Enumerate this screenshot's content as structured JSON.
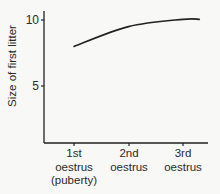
{
  "chart_data": {
    "type": "line",
    "title": "",
    "xlabel": "",
    "ylabel": "Size of first litter",
    "categories": [
      "1st oestrus (puberty)",
      "2nd oestrus",
      "3rd oestrus"
    ],
    "x_tick_labels": [
      {
        "lines": [
          "1st",
          "oestrus",
          "(puberty)"
        ]
      },
      {
        "lines": [
          "2nd",
          "oestrus"
        ]
      },
      {
        "lines": [
          "3rd",
          "oestrus"
        ]
      }
    ],
    "y_ticks": [
      5,
      10
    ],
    "y_tick_labels": [
      "5",
      "10"
    ],
    "ylim": [
      0.7,
      10.7
    ],
    "series": [
      {
        "name": "Size of first litter",
        "values": [
          8.0,
          9.5,
          10.05
        ],
        "smooth": true,
        "extends_to_x": 3.3,
        "end_value": 10.05
      }
    ],
    "grid": false,
    "legend": null
  },
  "colors": {
    "background": "#f8f8f6",
    "ink": "#222222"
  }
}
